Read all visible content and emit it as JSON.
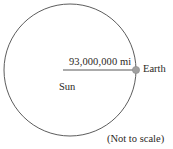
{
  "figure": {
    "type": "astronomy-diagram",
    "background_color": "#ffffff",
    "stroke_color": "#4a4a4a",
    "text_color": "#2b2724",
    "sun": {
      "label": "Sun",
      "shape": "circle",
      "center_x": 70,
      "center_y": 70,
      "radius": 66,
      "fill": "none"
    },
    "earth": {
      "label": "Earth",
      "shape": "dot",
      "center_x": 136,
      "center_y": 70,
      "radius": 3.5,
      "fill": "#9a9a9a"
    },
    "distance": {
      "label": "93,000,000 mi",
      "value": "93,000,000",
      "unit": "mi",
      "line_start_x": 63,
      "line_end_x": 133,
      "line_y": 70
    },
    "note": "(Not to scale)"
  }
}
